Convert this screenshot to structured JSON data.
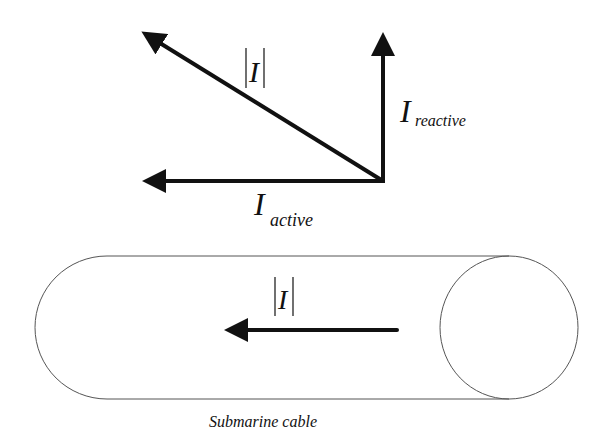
{
  "diagram": {
    "type": "phasor-and-cable",
    "phasor": {
      "magnitude_label": {
        "main": "I",
        "bars": "|",
        "text": "|I|"
      },
      "reactive_label": {
        "main": "I",
        "sub": "reactive"
      },
      "active_label": {
        "main": "I",
        "sub": "active"
      }
    },
    "cable": {
      "current_label": "I",
      "caption": "Submarine cable"
    },
    "colors": {
      "stroke": "#111111",
      "outline": "#555555",
      "background": "#ffffff"
    }
  }
}
